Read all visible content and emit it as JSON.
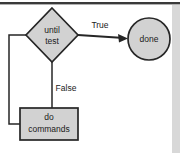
{
  "diagram": {
    "type": "flowchart",
    "canvas": {
      "width": 180,
      "height": 153,
      "background": "#ffffff"
    },
    "style": {
      "node_fill": "#d2d2d2",
      "node_stroke": "#262626",
      "edge_stroke": "#262626",
      "text_color": "#1a1a1a",
      "top_rule_color": "#3a3a3a",
      "right_strip_color": "#d8d8d8"
    },
    "nodes": {
      "decision": {
        "shape": "diamond",
        "label_line1": "until",
        "label_line2": "test",
        "cx": 52,
        "cy": 35,
        "rx": 26,
        "ry": 27
      },
      "terminal": {
        "shape": "circle",
        "label": "done",
        "cx": 149,
        "cy": 39,
        "r": 21
      },
      "process": {
        "shape": "rectangle",
        "label_line1": "do",
        "label_line2": "commands",
        "x": 20,
        "y": 108,
        "width": 58,
        "height": 32
      }
    },
    "edges": [
      {
        "id": "true-branch",
        "from": "decision",
        "to": "terminal",
        "label": "True",
        "label_x": 100,
        "label_y": 26,
        "arrowhead": true
      },
      {
        "id": "false-branch",
        "from": "decision",
        "to": "process",
        "label": "False",
        "label_x": 66,
        "label_y": 89,
        "arrowhead": false
      },
      {
        "id": "loop-back",
        "from": "process",
        "to": "decision",
        "label": "",
        "arrowhead": false
      }
    ]
  }
}
